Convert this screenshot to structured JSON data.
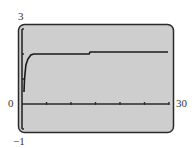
{
  "chart_data": {
    "type": "line",
    "title": "",
    "xlabel": "",
    "ylabel": "",
    "xlim": [
      0,
      30
    ],
    "ylim": [
      -1,
      3
    ],
    "x_tick_spacing": 5,
    "y_tick_spacing": 1,
    "grid": false,
    "legend": null,
    "tick_labels": {
      "xmin": "0",
      "xmax": "30",
      "ymax": "3",
      "ymin": "−1"
    },
    "series": [
      {
        "name": "curve",
        "x": [
          0.4,
          0.5,
          0.6,
          0.8,
          1.2,
          1.8,
          2.4,
          13.7,
          13.9,
          29.8
        ],
        "y": [
          0.48,
          0.9,
          1.16,
          1.56,
          1.8,
          1.96,
          2.0,
          2.0,
          2.08,
          2.08
        ]
      }
    ]
  },
  "labels": {
    "ymax": "3",
    "ymin": "−1",
    "xmin": "0",
    "xmax": "30"
  },
  "colors": {
    "screen": "#cecece",
    "border": "#2a2a2a",
    "curve": "#1a1a1a"
  }
}
